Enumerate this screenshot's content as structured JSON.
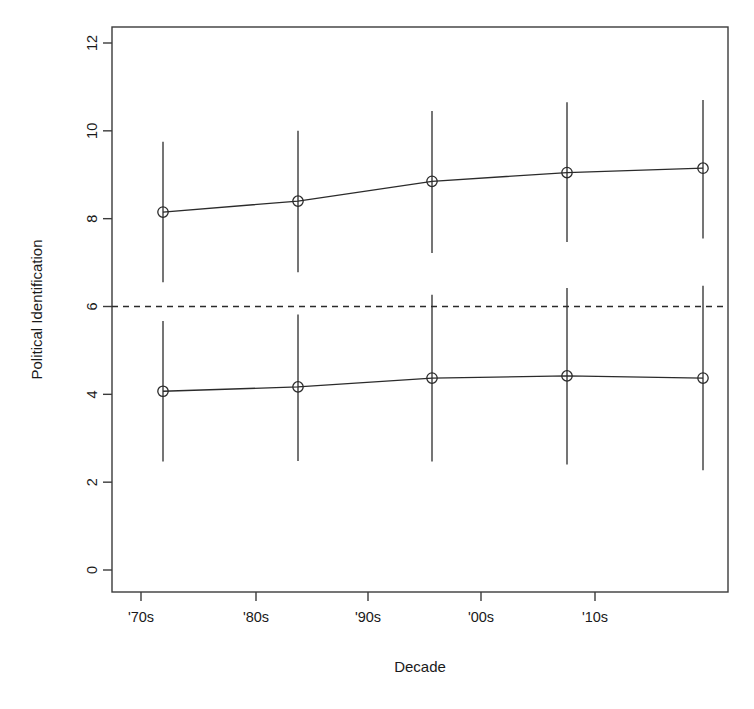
{
  "chart_data": {
    "type": "line",
    "title": "",
    "subtitle": "",
    "xlabel": "Decade",
    "ylabel": "Political Identification",
    "categories": [
      "'70s",
      "'80s",
      "'90s",
      "'00s",
      "'10s"
    ],
    "x": [
      1,
      2,
      3,
      4,
      5
    ],
    "xlim": [
      0.6,
      5.4
    ],
    "ylim": [
      -0.3,
      12.6
    ],
    "yticks": [
      0,
      2,
      4,
      6,
      8,
      10,
      12
    ],
    "ytick_labels": [
      "0",
      "2",
      "4",
      "6",
      "8",
      "10",
      "12"
    ],
    "xtick_labels": [
      "'70s",
      "'80s",
      "'90s",
      "'00s",
      "'10s"
    ],
    "grid": false,
    "legend": "none",
    "marker": "open-circle",
    "error_bars": true,
    "reference_line": {
      "orientation": "horizontal",
      "value": 6,
      "style": "dashed",
      "label": ""
    },
    "series": [
      {
        "name": "Upper series",
        "values": [
          8.15,
          8.4,
          8.85,
          9.05,
          9.15
        ],
        "error_low": [
          6.55,
          6.78,
          7.22,
          7.47,
          7.55
        ],
        "error_high": [
          9.75,
          10.0,
          10.45,
          10.65,
          10.7
        ]
      },
      {
        "name": "Lower series",
        "values": [
          4.07,
          4.17,
          4.37,
          4.42,
          4.37
        ],
        "error_low": [
          2.47,
          2.48,
          2.47,
          2.4,
          2.27
        ],
        "error_high": [
          5.67,
          5.82,
          6.27,
          6.42,
          6.47
        ]
      }
    ],
    "colors": {
      "line": "#2b2b2b",
      "axis": "#3b3b3b",
      "background": "#ffffff",
      "reference_line": "#2b2b2b"
    }
  }
}
